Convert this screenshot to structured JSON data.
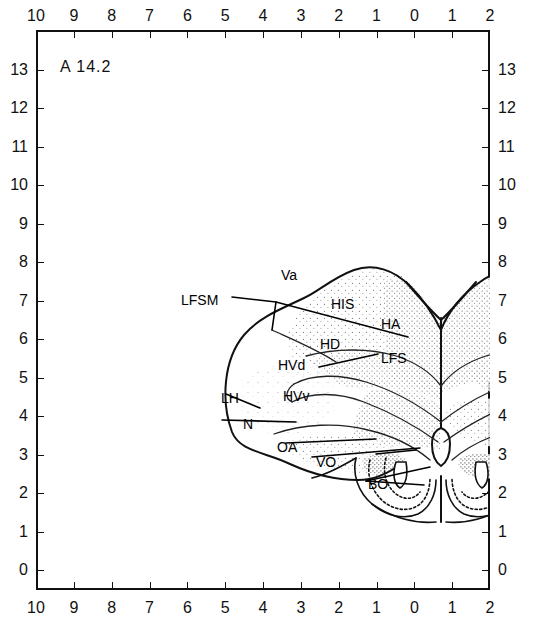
{
  "figure": {
    "title": "A  14.2",
    "panel_letter": "A",
    "section_level": "14.2",
    "background_color": "#ffffff",
    "line_color": "#111111",
    "stipple_color": "#7a7a7a"
  },
  "axes": {
    "x_top_labels": [
      "10",
      "9",
      "8",
      "7",
      "6",
      "5",
      "4",
      "3",
      "2",
      "1",
      "0",
      "1",
      "2"
    ],
    "x_bottom_labels": [
      "10",
      "9",
      "8",
      "7",
      "6",
      "5",
      "4",
      "3",
      "2",
      "1",
      "0",
      "1",
      "2"
    ],
    "y_left_labels": [
      "13",
      "12",
      "11",
      "10",
      "9",
      "8",
      "7",
      "6",
      "5",
      "4",
      "3",
      "2",
      "1",
      "0"
    ],
    "y_right_labels": [
      "13",
      "12",
      "11",
      "10",
      "9",
      "8",
      "7",
      "6",
      "5",
      "4",
      "3",
      "2",
      "1",
      "0"
    ],
    "x_range": [
      10,
      -2
    ],
    "y_range": [
      0,
      13
    ],
    "grid": false
  },
  "structures": [
    {
      "id": "Va",
      "label": "Va",
      "x": 281,
      "y": 268
    },
    {
      "id": "LFSM",
      "label": "LFSM",
      "x": 181,
      "y": 293
    },
    {
      "id": "HIS",
      "label": "HIS",
      "x": 331,
      "y": 297
    },
    {
      "id": "HA",
      "label": "HA",
      "x": 381,
      "y": 317
    },
    {
      "id": "HD",
      "label": "HD",
      "x": 320,
      "y": 337
    },
    {
      "id": "LFS",
      "label": "LFS",
      "x": 381,
      "y": 351
    },
    {
      "id": "HVd",
      "label": "HVd",
      "x": 278,
      "y": 358
    },
    {
      "id": "HVv",
      "label": "HVv",
      "x": 283,
      "y": 389
    },
    {
      "id": "LH",
      "label": "LH",
      "x": 221,
      "y": 391
    },
    {
      "id": "N",
      "label": "N",
      "x": 243,
      "y": 417
    },
    {
      "id": "OA",
      "label": "OA",
      "x": 277,
      "y": 440
    },
    {
      "id": "VO",
      "label": "VO",
      "x": 316,
      "y": 455
    },
    {
      "id": "BO",
      "label": "BO",
      "x": 368,
      "y": 477
    }
  ]
}
